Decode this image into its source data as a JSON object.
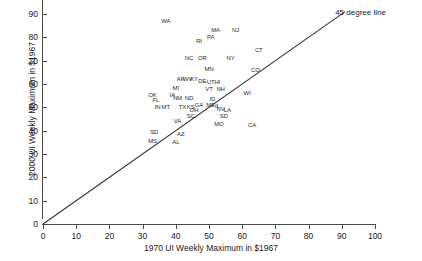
{
  "chart_data": {
    "type": "scatter",
    "title": "",
    "xlabel": "1970 UI Weekly Maximum in $1967",
    "ylabel": "2000 UI Weekly Maximum in $1967",
    "xlim": [
      0,
      100
    ],
    "ylim": [
      0,
      90
    ],
    "xticks": [
      0,
      10,
      20,
      30,
      40,
      50,
      60,
      70,
      80,
      90,
      100
    ],
    "yticks": [
      0,
      10,
      20,
      30,
      40,
      50,
      60,
      70,
      80,
      90
    ],
    "grid": false,
    "legend": "none",
    "point_marker": "state-abbreviation-text",
    "annotations": [
      {
        "text": "45 degree line",
        "x": 88,
        "y": 90.5
      }
    ],
    "reference_lines": [
      {
        "name": "45 degree line",
        "type": "identity",
        "from": [
          0,
          0
        ],
        "to": [
          91,
          91
        ],
        "color": "#333333"
      }
    ],
    "points": [
      {
        "label": "WA",
        "x": 37.0,
        "y": 87.0
      },
      {
        "label": "MA",
        "x": 52.0,
        "y": 83.0
      },
      {
        "label": "NJ",
        "x": 58.0,
        "y": 83.0
      },
      {
        "label": "RI",
        "x": 47.0,
        "y": 78.5
      },
      {
        "label": "PA",
        "x": 50.5,
        "y": 80.0
      },
      {
        "label": "CT",
        "x": 65.0,
        "y": 74.5
      },
      {
        "label": "NC",
        "x": 44.0,
        "y": 71.0
      },
      {
        "label": "OR",
        "x": 48.0,
        "y": 71.0
      },
      {
        "label": "NY",
        "x": 56.5,
        "y": 71.0
      },
      {
        "label": "MN",
        "x": 50.0,
        "y": 66.5
      },
      {
        "label": "CO",
        "x": 64.0,
        "y": 66.0
      },
      {
        "label": "AK",
        "x": 41.5,
        "y": 62.0
      },
      {
        "label": "WV",
        "x": 43.5,
        "y": 62.0
      },
      {
        "label": "KY",
        "x": 45.5,
        "y": 62.0
      },
      {
        "label": "DE",
        "x": 48.0,
        "y": 61.5
      },
      {
        "label": "UT",
        "x": 50.5,
        "y": 61.0
      },
      {
        "label": "HI",
        "x": 52.5,
        "y": 61.0
      },
      {
        "label": "MI",
        "x": 40.0,
        "y": 58.5
      },
      {
        "label": "VT",
        "x": 50.0,
        "y": 58.0
      },
      {
        "label": "NH",
        "x": 53.5,
        "y": 58.0
      },
      {
        "label": "WI",
        "x": 61.5,
        "y": 56.0
      },
      {
        "label": "OK",
        "x": 33.0,
        "y": 55.5
      },
      {
        "label": "IA",
        "x": 39.0,
        "y": 55.5
      },
      {
        "label": "NM",
        "x": 40.5,
        "y": 54.0
      },
      {
        "label": "ND",
        "x": 44.0,
        "y": 54.0
      },
      {
        "label": "ID",
        "x": 51.0,
        "y": 53.5
      },
      {
        "label": "FL",
        "x": 34.0,
        "y": 53.0
      },
      {
        "label": "GA",
        "x": 47.0,
        "y": 51.0
      },
      {
        "label": "ME",
        "x": 50.5,
        "y": 51.0
      },
      {
        "label": "IL",
        "x": 52.5,
        "y": 50.5
      },
      {
        "label": "IN",
        "x": 34.5,
        "y": 50.0
      },
      {
        "label": "MT",
        "x": 37.0,
        "y": 50.0
      },
      {
        "label": "TX",
        "x": 42.0,
        "y": 50.0
      },
      {
        "label": "KS",
        "x": 44.5,
        "y": 50.0
      },
      {
        "label": "NV",
        "x": 53.5,
        "y": 49.5
      },
      {
        "label": "LA",
        "x": 55.5,
        "y": 49.0
      },
      {
        "label": "OH",
        "x": 45.5,
        "y": 49.0
      },
      {
        "label": "SC",
        "x": 44.5,
        "y": 46.5
      },
      {
        "label": "SD",
        "x": 54.5,
        "y": 46.5
      },
      {
        "label": "VA",
        "x": 40.5,
        "y": 44.0
      },
      {
        "label": "MO",
        "x": 53.0,
        "y": 43.0
      },
      {
        "label": "CA",
        "x": 63.0,
        "y": 42.5
      },
      {
        "label": "SD",
        "x": 33.5,
        "y": 39.5
      },
      {
        "label": "AZ",
        "x": 41.5,
        "y": 38.5
      },
      {
        "label": "MS",
        "x": 33.0,
        "y": 35.5
      },
      {
        "label": "AL",
        "x": 40.0,
        "y": 35.0
      }
    ]
  }
}
